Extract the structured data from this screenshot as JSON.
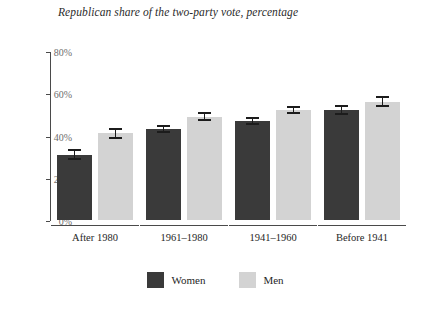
{
  "chart_data": {
    "type": "bar",
    "title": "Republican share of the two-party vote, percentage",
    "xlabel": "",
    "ylabel": "",
    "ylim": [
      0,
      80
    ],
    "yticks": [
      0,
      20,
      40,
      60,
      80
    ],
    "ytick_labels": [
      "0%",
      "20%",
      "40%",
      "60%",
      "80%"
    ],
    "grid": false,
    "legend_position": "bottom-center",
    "categories": [
      "After 1980",
      "1961–1980",
      "1941–1960",
      "Before 1941"
    ],
    "series": [
      {
        "name": "Women",
        "color": "#3a3a3a",
        "values": [
          31,
          43,
          47,
          52
        ],
        "error_low": [
          29,
          41.5,
          45.5,
          50
        ],
        "error_high": [
          33,
          44.5,
          48.5,
          54
        ]
      },
      {
        "name": "Men",
        "color": "#d3d3d3",
        "values": [
          41,
          49,
          52,
          56
        ],
        "error_low": [
          39,
          47.5,
          50.5,
          54
        ],
        "error_high": [
          43,
          50.5,
          53.5,
          58
        ]
      }
    ]
  },
  "legend": {
    "items": [
      {
        "label": "Women",
        "color": "#3a3a3a"
      },
      {
        "label": "Men",
        "color": "#d3d3d3"
      }
    ]
  },
  "caption": ""
}
